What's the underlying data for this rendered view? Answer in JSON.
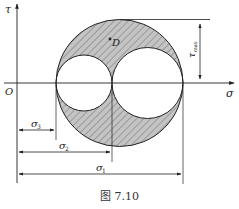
{
  "figure": {
    "caption": "图 7.10",
    "axes": {
      "x_label": "σ",
      "y_label": "τ",
      "origin_label": "O"
    },
    "point_label": "D",
    "dimensions": {
      "tau_max": "τ",
      "tau_max_sub": "max",
      "sigma_3": "σ",
      "sigma_3_sub": "3",
      "sigma_2": "σ",
      "sigma_2_sub": "2",
      "sigma_1": "σ",
      "sigma_1_sub": "1"
    },
    "colors": {
      "line": "#222222",
      "fill": "#b8b8b8",
      "hatch": "#555555"
    }
  }
}
